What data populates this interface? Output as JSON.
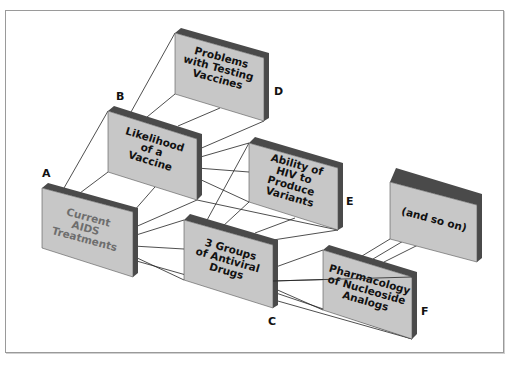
{
  "diagram": {
    "colors": {
      "card_face": "#c7c7c7",
      "card_back": "#4a4a4a",
      "card_edge": "#555555",
      "connector": "#222222",
      "muted_text": "#6e6e6e",
      "text": "#111111",
      "frame": "#9a9a9a"
    },
    "cards": [
      {
        "id": "A",
        "label_letter": "A",
        "lines": [
          "Current",
          "AIDS",
          "Treatments"
        ],
        "muted": true
      },
      {
        "id": "B",
        "label_letter": "B",
        "lines": [
          "Likelihood",
          "of a",
          "Vaccine"
        ],
        "muted": false
      },
      {
        "id": "D",
        "label_letter": "D",
        "lines": [
          "Problems",
          "with Testing",
          "Vaccines"
        ],
        "muted": false
      },
      {
        "id": "E",
        "label_letter": "E",
        "lines": [
          "Ability of",
          "HIV to",
          "Produce",
          "Variants"
        ],
        "muted": false
      },
      {
        "id": "C",
        "label_letter": "C",
        "lines": [
          "3 Groups",
          "of Antiviral",
          "Drugs"
        ],
        "muted": false
      },
      {
        "id": "F",
        "label_letter": "F",
        "lines": [
          "Pharmacology",
          "of Nucleoside",
          "Analogs"
        ],
        "muted": false
      },
      {
        "id": "G",
        "label_letter": "",
        "lines": [
          "(and so on)"
        ],
        "muted": false
      }
    ]
  }
}
